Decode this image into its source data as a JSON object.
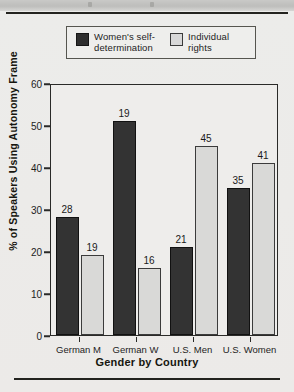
{
  "chart_data": {
    "type": "bar",
    "title": "",
    "xlabel": "Gender by Country",
    "ylabel": "% of Speakers Using Autonomy Frame",
    "categories": [
      "German M",
      "German W",
      "U.S. Men",
      "U.S. Women"
    ],
    "ylim": [
      0,
      60
    ],
    "yticks": [
      0,
      10,
      20,
      30,
      40,
      50,
      60
    ],
    "grid": false,
    "legend_position": "top",
    "series": [
      {
        "name": "Women's self-determination",
        "color": "#333333",
        "values": [
          28,
          51,
          21,
          35
        ],
        "labels": [
          "28",
          "19",
          "21",
          "35"
        ]
      },
      {
        "name": "Individual rights",
        "color": "#d9d9d7",
        "values": [
          19,
          16,
          45,
          41
        ],
        "labels": [
          "19",
          "16",
          "45",
          "41"
        ]
      }
    ]
  },
  "legend": {
    "items": [
      {
        "label": "Women's self-\ndetermination",
        "swatch": "dark-swatch"
      },
      {
        "label": "Individual\nrights",
        "swatch": "light-swatch"
      }
    ]
  },
  "axes": {
    "y_title": "% of Speakers Using Autonomy Frame",
    "x_title": "Gender by Country",
    "y_tick_labels": [
      "60",
      "50",
      "40",
      "30",
      "20",
      "10",
      "0"
    ]
  }
}
